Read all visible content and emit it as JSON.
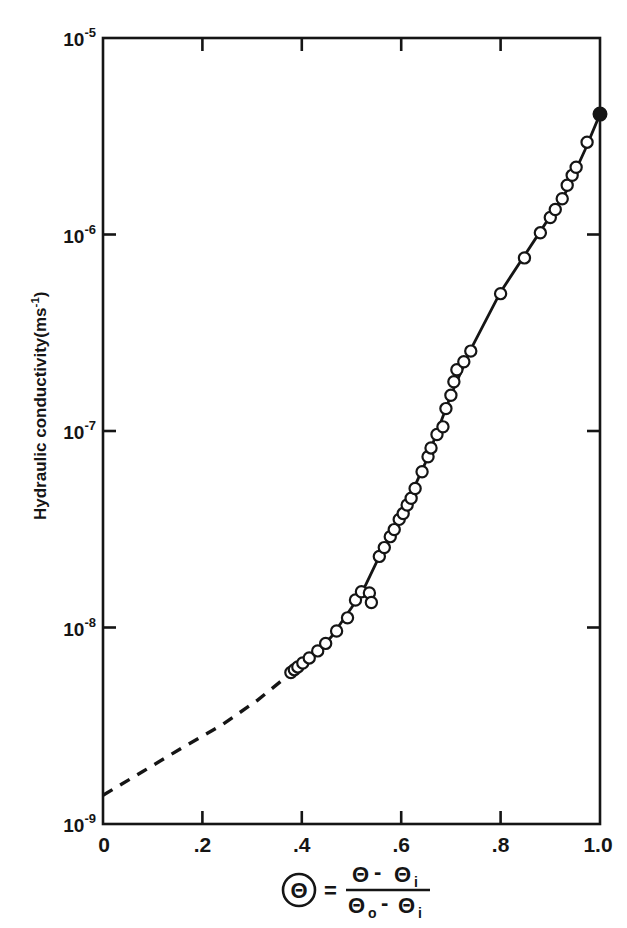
{
  "figure": {
    "background_color": "#ffffff",
    "ink_color": "#151515"
  },
  "axes": {
    "y_title_parts": {
      "main": "Hydraulic conductivity(ms",
      "superscript": "-1",
      "tail": ")"
    },
    "y_title_full": "Hydraulic conductivity(ms-1)",
    "y_ticks": [
      {
        "mantissa": "10",
        "exponent": "-5",
        "value": 1e-05
      },
      {
        "mantissa": "10",
        "exponent": "-6",
        "value": 1e-06
      },
      {
        "mantissa": "10",
        "exponent": "-7",
        "value": 1e-07
      },
      {
        "mantissa": "10",
        "exponent": "-8",
        "value": 1e-08
      },
      {
        "mantissa": "10",
        "exponent": "-9",
        "value": 1e-09
      }
    ],
    "x_ticks": [
      {
        "label": "0",
        "value": 0.0
      },
      {
        "label": ".2",
        "value": 0.2
      },
      {
        "label": ".4",
        "value": 0.4
      },
      {
        "label": ".6",
        "value": 0.6
      },
      {
        "label": ".8",
        "value": 0.8
      },
      {
        "label": "1.0",
        "value": 1.0
      }
    ],
    "x_title_formula": {
      "circled_symbol": "Θ",
      "equals": "=",
      "numerator_theta": "Θ",
      "numerator_minus": "-",
      "numerator_theta_sub": "Θ",
      "numerator_sub": "i",
      "denominator_theta": "Θ",
      "denominator_sub_o": "o",
      "denominator_minus": "-",
      "denominator_theta_sub": "Θ",
      "denominator_sub_i": "i"
    },
    "x_title_plain": "Θ = (Θ - Θi) / (Θo - Θi)"
  },
  "chart_data": {
    "type": "scatter",
    "title": "",
    "subtitle": "",
    "xlabel": "Θ = (Θ - Θi) / (Θo - Θi)",
    "ylabel": "Hydraulic conductivity (ms^-1)",
    "xlim": [
      0.0,
      1.0
    ],
    "ylim": [
      1e-09,
      1e-05
    ],
    "yscale": "log",
    "xscale": "linear",
    "grid": false,
    "legend": false,
    "legend_position": "none",
    "series": [
      {
        "name": "Measured hydraulic conductivity",
        "marker": "open-circle",
        "marker_fill": "#ffffff",
        "marker_edge": "#151515",
        "points": [
          {
            "x": 0.378,
            "y": 5.9e-09
          },
          {
            "x": 0.385,
            "y": 6.1e-09
          },
          {
            "x": 0.392,
            "y": 6.3e-09
          },
          {
            "x": 0.402,
            "y": 6.6e-09
          },
          {
            "x": 0.415,
            "y": 7e-09
          },
          {
            "x": 0.432,
            "y": 7.6e-09
          },
          {
            "x": 0.448,
            "y": 8.3e-09
          },
          {
            "x": 0.47,
            "y": 9.6e-09
          },
          {
            "x": 0.492,
            "y": 1.12e-08
          },
          {
            "x": 0.508,
            "y": 1.38e-08
          },
          {
            "x": 0.52,
            "y": 1.52e-08
          },
          {
            "x": 0.536,
            "y": 1.5e-08
          },
          {
            "x": 0.54,
            "y": 1.34e-08
          },
          {
            "x": 0.556,
            "y": 2.3e-08
          },
          {
            "x": 0.566,
            "y": 2.55e-08
          },
          {
            "x": 0.578,
            "y": 2.9e-08
          },
          {
            "x": 0.586,
            "y": 3.15e-08
          },
          {
            "x": 0.596,
            "y": 3.55e-08
          },
          {
            "x": 0.604,
            "y": 3.8e-08
          },
          {
            "x": 0.612,
            "y": 4.2e-08
          },
          {
            "x": 0.62,
            "y": 4.55e-08
          },
          {
            "x": 0.628,
            "y": 5.1e-08
          },
          {
            "x": 0.642,
            "y": 6.2e-08
          },
          {
            "x": 0.654,
            "y": 7.4e-08
          },
          {
            "x": 0.66,
            "y": 8.2e-08
          },
          {
            "x": 0.672,
            "y": 9.6e-08
          },
          {
            "x": 0.684,
            "y": 1.05e-07
          },
          {
            "x": 0.69,
            "y": 1.3e-07
          },
          {
            "x": 0.7,
            "y": 1.52e-07
          },
          {
            "x": 0.706,
            "y": 1.78e-07
          },
          {
            "x": 0.712,
            "y": 2.05e-07
          },
          {
            "x": 0.726,
            "y": 2.25e-07
          },
          {
            "x": 0.74,
            "y": 2.55e-07
          },
          {
            "x": 0.8,
            "y": 5e-07
          },
          {
            "x": 0.848,
            "y": 7.6e-07
          },
          {
            "x": 0.88,
            "y": 1.02e-06
          },
          {
            "x": 0.9,
            "y": 1.22e-06
          },
          {
            "x": 0.91,
            "y": 1.34e-06
          },
          {
            "x": 0.924,
            "y": 1.52e-06
          },
          {
            "x": 0.934,
            "y": 1.78e-06
          },
          {
            "x": 0.944,
            "y": 2e-06
          },
          {
            "x": 0.952,
            "y": 2.2e-06
          },
          {
            "x": 0.974,
            "y": 2.95e-06
          }
        ]
      },
      {
        "name": "Saturated hydraulic conductivity",
        "marker": "filled-circle",
        "marker_fill": "#151515",
        "marker_edge": "#151515",
        "points": [
          {
            "x": 1.0,
            "y": 4.1e-06
          }
        ]
      }
    ],
    "fitted_curve_solid": {
      "name": "Fitted curve (measured range)",
      "style": "solid",
      "points": [
        {
          "x": 0.378,
          "y": 5.85e-09
        },
        {
          "x": 0.42,
          "y": 7.05e-09
        },
        {
          "x": 0.46,
          "y": 9e-09
        },
        {
          "x": 0.5,
          "y": 1.26e-08
        },
        {
          "x": 0.524,
          "y": 1.56e-08
        },
        {
          "x": 0.556,
          "y": 2.3e-08
        },
        {
          "x": 0.6,
          "y": 3.7e-08
        },
        {
          "x": 0.65,
          "y": 7e-08
        },
        {
          "x": 0.7,
          "y": 1.52e-07
        },
        {
          "x": 0.74,
          "y": 2.6e-07
        },
        {
          "x": 0.8,
          "y": 5.1e-07
        },
        {
          "x": 0.87,
          "y": 9.5e-07
        },
        {
          "x": 0.93,
          "y": 1.62e-06
        },
        {
          "x": 0.97,
          "y": 2.7e-06
        },
        {
          "x": 1.0,
          "y": 4.1e-06
        }
      ]
    },
    "extrapolated_curve_dashed": {
      "name": "Extrapolated curve",
      "style": "dashed",
      "points": [
        {
          "x": 0.0,
          "y": 1.4e-09
        },
        {
          "x": 0.08,
          "y": 1.85e-09
        },
        {
          "x": 0.16,
          "y": 2.45e-09
        },
        {
          "x": 0.24,
          "y": 3.2e-09
        },
        {
          "x": 0.31,
          "y": 4.25e-09
        },
        {
          "x": 0.378,
          "y": 5.85e-09
        }
      ]
    },
    "annotations": []
  }
}
